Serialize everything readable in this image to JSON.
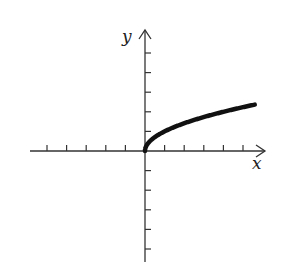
{
  "chart_data": {
    "type": "line",
    "title": "",
    "function": "y = sqrt(x)",
    "xlabel": "x",
    "ylabel": "y",
    "xlim": [
      -5,
      6
    ],
    "ylim": [
      -5,
      6
    ],
    "x_ticks": [
      -5,
      -4,
      -3,
      -2,
      -1,
      1,
      2,
      3,
      4,
      5
    ],
    "y_ticks": [
      -5,
      -4,
      -3,
      -2,
      -1,
      1,
      2,
      3,
      4,
      5
    ],
    "tick_labels_shown": false,
    "grid": false,
    "legend": null,
    "series": [
      {
        "name": "sqrt(x)",
        "x": [
          0,
          0.05,
          0.25,
          0.5,
          1,
          1.5,
          2,
          2.5,
          3,
          3.5,
          4,
          4.5,
          5,
          5.6
        ],
        "y": [
          0,
          0.224,
          0.5,
          0.707,
          1,
          1.225,
          1.414,
          1.581,
          1.732,
          1.871,
          2,
          2.121,
          2.236,
          2.366
        ]
      }
    ],
    "color": "#111111"
  },
  "geometry": {
    "origin_px": [
      145,
      151
    ],
    "unit_px": 19.6,
    "x_axis_px": [
      30,
      265
    ],
    "y_axis_px": [
      30,
      262
    ]
  }
}
